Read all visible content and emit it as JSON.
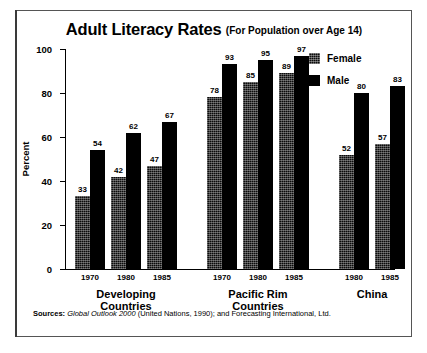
{
  "chart_data": {
    "type": "bar",
    "title": "Adult Literacy Rates",
    "subtitle": "(For Population over Age 14)",
    "xlabel": "",
    "ylabel": "Percent",
    "ylim": [
      0,
      100
    ],
    "yticks": [
      0,
      20,
      40,
      60,
      80,
      100
    ],
    "grid": false,
    "legend_position": "upper-right",
    "groups": [
      {
        "name": "Developing Countries",
        "label_lines": [
          "Developing",
          "Countries"
        ],
        "years": [
          "1970",
          "1980",
          "1985"
        ]
      },
      {
        "name": "Pacific Rim Countries",
        "label_lines": [
          "Pacific Rim",
          "Countries"
        ],
        "years": [
          "1970",
          "1980",
          "1985"
        ]
      },
      {
        "name": "China",
        "label_lines": [
          "China",
          ""
        ],
        "years": [
          "1980",
          "1985"
        ]
      },
      {
        "name": "Least-Developed Countries",
        "label_lines": [
          "Least-Developed",
          "Countries"
        ],
        "years": [
          "1970",
          "1980",
          "1985"
        ]
      }
    ],
    "categories": [
      "Developing Countries 1970",
      "Developing Countries 1980",
      "Developing Countries 1985",
      "Pacific Rim Countries 1970",
      "Pacific Rim Countries 1980",
      "Pacific Rim Countries 1985",
      "China 1980",
      "China 1985",
      "Least-Developed Countries 1970",
      "Least-Developed Countries 1980",
      "Least-Developed Countries 1985"
    ],
    "series": [
      {
        "name": "Female",
        "color": "#0b0b0b",
        "fill": "dithered",
        "values": [
          33,
          42,
          47,
          78,
          85,
          89,
          52,
          57,
          9,
          16,
          27
        ]
      },
      {
        "name": "Male",
        "color": "#000000",
        "fill": "solid",
        "values": [
          54,
          62,
          67,
          93,
          95,
          97,
          80,
          83,
          27,
          36,
          47
        ]
      }
    ]
  },
  "legend": {
    "items": [
      {
        "label": "Female"
      },
      {
        "label": "Male"
      }
    ]
  },
  "sources": {
    "label": "Sources:",
    "text_italic": "Global Outlook 2000",
    "text_rest": "(United Nations, 1990); and Forecasting International, Ltd."
  }
}
